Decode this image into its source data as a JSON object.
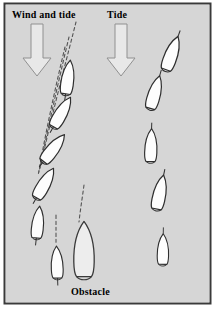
{
  "figure": {
    "width": 218,
    "height": 316,
    "background_color": "#d6d6d6",
    "frame_color": "#3a3a3a",
    "page_color": "#ffffff"
  },
  "labels": {
    "wind_and_tide": "Wind and tide",
    "tide": "Tide",
    "obstacle": "Obstacle"
  },
  "arrows": [
    {
      "name": "wind-and-tide-arrow",
      "label": "Wind and tide",
      "direction": "down",
      "x": 37,
      "y_top": 24,
      "y_bottom": 75,
      "fill": "#e8e8e8",
      "stroke": "#8a8a8a"
    },
    {
      "name": "tide-arrow",
      "label": "Tide",
      "direction": "down",
      "x": 121,
      "y_top": 24,
      "y_bottom": 75,
      "fill": "#e8e8e8",
      "stroke": "#8a8a8a"
    }
  ],
  "tracks": [
    {
      "name": "wind-and-tide-track",
      "description": "Left track: boat drifts down and to the left while swinging bow to port, under combined wind and tide",
      "boat_count": 6,
      "boats": [
        {
          "cx": 68,
          "cy": 77,
          "angle": 8,
          "length": 34,
          "beam": 13,
          "fill": "#fdfdfd"
        },
        {
          "cx": 62,
          "cy": 112,
          "angle": 30,
          "length": 34,
          "beam": 13,
          "fill": "#fdfdfd"
        },
        {
          "cx": 54,
          "cy": 148,
          "angle": 38,
          "length": 34,
          "beam": 13,
          "fill": "#fdfdfd"
        },
        {
          "cx": 45,
          "cy": 183,
          "angle": 30,
          "length": 34,
          "beam": 13,
          "fill": "#fdfdfd"
        },
        {
          "cx": 38,
          "cy": 222,
          "angle": 6,
          "length": 32,
          "beam": 12,
          "fill": "#fdfdfd"
        },
        {
          "cx": 57,
          "cy": 262,
          "angle": -2,
          "length": 32,
          "beam": 12,
          "fill": "#fdfdfd"
        }
      ]
    },
    {
      "name": "tide-only-track",
      "description": "Right track: boat carried straight downstream by the tide alone, bow swinging only slightly",
      "boat_count": 5,
      "boats": [
        {
          "cx": 172,
          "cy": 53,
          "angle": 20,
          "length": 36,
          "beam": 13,
          "fill": "#fdfdfd"
        },
        {
          "cx": 155,
          "cy": 92,
          "angle": 16,
          "length": 34,
          "beam": 13,
          "fill": "#fdfdfd"
        },
        {
          "cx": 151,
          "cy": 145,
          "angle": 2,
          "length": 33,
          "beam": 13,
          "fill": "#fdfdfd"
        },
        {
          "cx": 160,
          "cy": 192,
          "angle": 12,
          "length": 35,
          "beam": 13,
          "fill": "#fdfdfd"
        },
        {
          "cx": 163,
          "cy": 249,
          "angle": 1,
          "length": 31,
          "beam": 12,
          "fill": "#fdfdfd"
        }
      ]
    }
  ],
  "obstacle_boat": {
    "name": "obstacle-boat",
    "label": "Obstacle",
    "cx": 84,
    "cy": 249,
    "angle": 0,
    "length": 58,
    "beam": 18,
    "fill": "#ededed",
    "stroke": "#3a3a3a"
  },
  "guide_lines": {
    "name": "heading-guide-lines",
    "style": "dashed",
    "color": "#555555",
    "count": 5,
    "description": "Dashed projections of each boat's heading converging toward the obstacle"
  }
}
